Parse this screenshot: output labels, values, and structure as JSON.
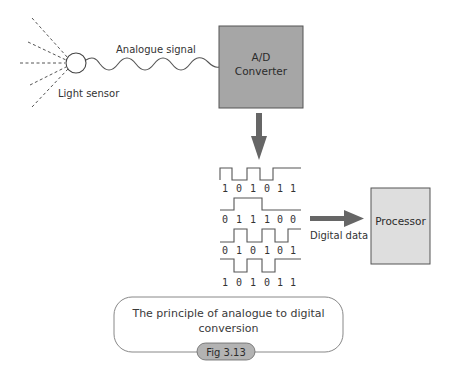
{
  "diagram": {
    "light_sensor": {
      "label": "Light sensor"
    },
    "analogue_signal": {
      "label": "Analogue signal"
    },
    "converter": {
      "line1": "A/D",
      "line2": "Converter",
      "fill": "#a6a6a6"
    },
    "digital_data": {
      "label": "Digital data"
    },
    "processor": {
      "label": "Processor",
      "fill": "#dedede"
    },
    "bit_streams": [
      {
        "bits": [
          "1",
          "0",
          "1",
          "0",
          "1",
          "1"
        ]
      },
      {
        "bits": [
          "0",
          "1",
          "1",
          "1",
          "0",
          "0"
        ]
      },
      {
        "bits": [
          "0",
          "1",
          "0",
          "1",
          "0",
          "1"
        ]
      },
      {
        "bits": [
          "1",
          "0",
          "1",
          "0",
          "1",
          "1"
        ]
      }
    ],
    "arrow_color": "#666666"
  },
  "caption": {
    "line1": "The principle of analogue to digital",
    "line2": "conversion",
    "figure_label": "Fig 3.13",
    "figure_badge_fill": "#b3b3b3"
  }
}
